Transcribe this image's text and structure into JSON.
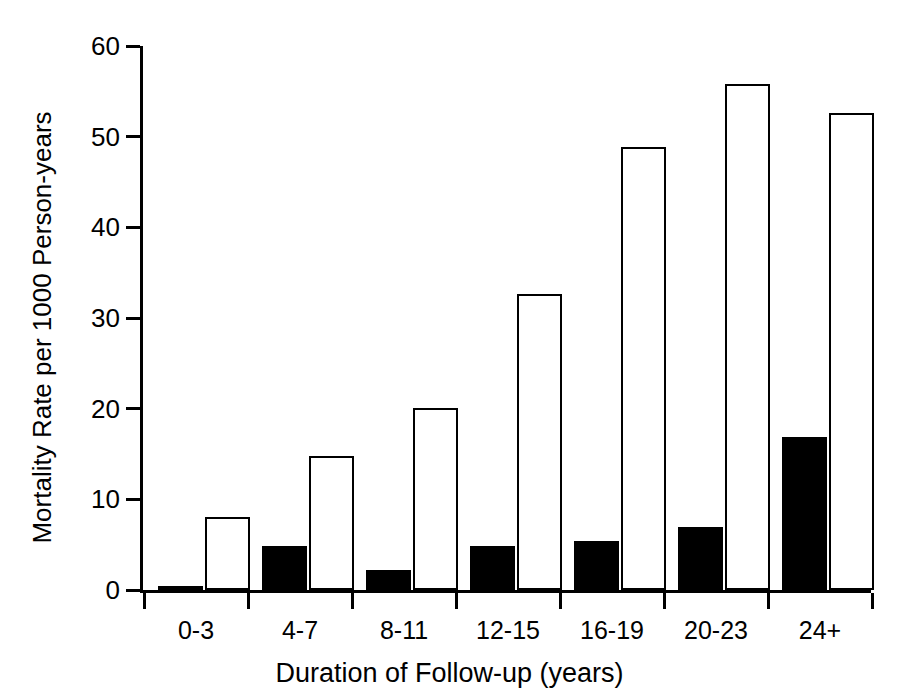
{
  "chart_data": {
    "type": "bar",
    "title": "",
    "xlabel": "Duration of Follow-up (years)",
    "ylabel": "Mortality Rate per 1000 Person-years",
    "categories": [
      "0-3",
      "4-7",
      "8-11",
      "12-15",
      "16-19",
      "20-23",
      "24+"
    ],
    "series": [
      {
        "name": "filled",
        "style": "solid-black",
        "values": [
          0.3,
          4.8,
          2.2,
          4.8,
          5.4,
          6.9,
          16.9
        ]
      },
      {
        "name": "open",
        "style": "white-outlined",
        "values": [
          8.1,
          14.8,
          20.1,
          32.7,
          48.9,
          55.8,
          52.6
        ]
      }
    ],
    "ylim": [
      0,
      60
    ],
    "yticks": [
      0,
      10,
      20,
      30,
      40,
      50,
      60
    ],
    "ytick_labels": [
      "0",
      "10",
      "20",
      "30",
      "40",
      "50",
      "60"
    ],
    "grid": false,
    "legend": "none",
    "axis_color": "#000000",
    "background": "#ffffff"
  }
}
